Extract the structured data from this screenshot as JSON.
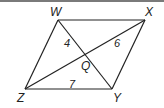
{
  "figure": {
    "type": "parallelogram with diagonals",
    "vertices": {
      "W": {
        "label": "W",
        "x": 58,
        "y": 20
      },
      "X": {
        "label": "X",
        "x": 145,
        "y": 20
      },
      "Y": {
        "label": "Y",
        "x": 112,
        "y": 89
      },
      "Z": {
        "label": "Z",
        "x": 25,
        "y": 89
      }
    },
    "intersection": {
      "label": "Q",
      "x": 86,
      "y": 55
    },
    "segment_labels": {
      "WQ": "4",
      "XQ": "6",
      "ZY": "7"
    }
  }
}
